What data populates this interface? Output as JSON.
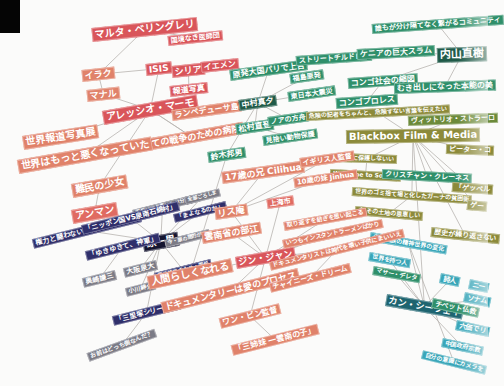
{
  "colors": {
    "background": "#fbfbfa",
    "red": "#d9555a",
    "salmon": "#e0826a",
    "coral": "#e06b62",
    "navy": "#2f2f6b",
    "gray": "#7b7b86",
    "black_node": "#151530",
    "green": "#2f8f6a",
    "dark_green": "#1f5a48",
    "olive": "#8c8a3a",
    "olive_green": "#6b8a3a",
    "teal": "#3aa6b8",
    "dark_teal": "#1e6470",
    "line": "#b8b4b0"
  },
  "nodes": [
    {
      "id": "maruta",
      "label": "マルタ・ベリングレリ",
      "x": 92,
      "y": 28,
      "fs": 10,
      "c": "red",
      "rot": -6
    },
    {
      "id": "kokkyo",
      "label": "国境なき医師団",
      "x": 168,
      "y": 36,
      "fs": 7,
      "c": "red",
      "rot": -6
    },
    {
      "id": "iraku",
      "label": "イラク",
      "x": 82,
      "y": 70,
      "fs": 9,
      "c": "salmon",
      "rot": -6
    },
    {
      "id": "isis",
      "label": "ISIS",
      "x": 146,
      "y": 64,
      "fs": 9,
      "c": "red",
      "rot": -6
    },
    {
      "id": "shiria",
      "label": "シリア",
      "x": 172,
      "y": 66,
      "fs": 9,
      "c": "red",
      "rot": -6
    },
    {
      "id": "yemen",
      "label": "イエメン",
      "x": 201,
      "y": 62,
      "fs": 8,
      "c": "red",
      "rot": -6
    },
    {
      "id": "manaru",
      "label": "マナル",
      "x": 87,
      "y": 90,
      "fs": 9,
      "c": "salmon",
      "rot": -6
    },
    {
      "id": "hodo",
      "label": "報道写真",
      "x": 170,
      "y": 86,
      "fs": 8,
      "c": "red",
      "rot": -6
    },
    {
      "id": "alessio",
      "label": "アレッシオ・マーモ",
      "x": 103,
      "y": 111,
      "fs": 10,
      "c": "red",
      "rot": -10
    },
    {
      "id": "lampedusa",
      "label": "ランペデューサ島",
      "x": 172,
      "y": 110,
      "fs": 8,
      "c": "salmon",
      "rot": -8
    },
    {
      "id": "sekaihodo",
      "label": "世界報道写真展",
      "x": 23,
      "y": 136,
      "fs": 10,
      "c": "salmon",
      "rot": -9
    },
    {
      "id": "subete",
      "label": "全ての戦争のための病院",
      "x": 140,
      "y": 140,
      "fs": 9,
      "c": "salmon",
      "rot": -10
    },
    {
      "id": "sekaiwa",
      "label": "世界はもっと悪くなっていた",
      "x": 18,
      "y": 160,
      "fs": 10,
      "c": "salmon",
      "rot": -10
    },
    {
      "id": "nanmin",
      "label": "難民の少女",
      "x": 72,
      "y": 184,
      "fs": 10,
      "c": "salmon",
      "rot": -10
    },
    {
      "id": "anman",
      "label": "アンマン",
      "x": 72,
      "y": 210,
      "fs": 10,
      "c": "coral",
      "rot": -10
    },
    {
      "id": "genpatsu",
      "label": "原発大国パリで上告",
      "x": 230,
      "y": 70,
      "fs": 8,
      "c": "green",
      "rot": -8
    },
    {
      "id": "fukushima",
      "label": "福島原発",
      "x": 290,
      "y": 74,
      "fs": 7,
      "c": "green",
      "rot": -8
    },
    {
      "id": "nakamura",
      "label": "中村真夕",
      "x": 239,
      "y": 100,
      "fs": 8,
      "c": "dark_green",
      "rot": -8
    },
    {
      "id": "higashi",
      "label": "東日本大震災",
      "x": 288,
      "y": 92,
      "fs": 7,
      "c": "green",
      "rot": -8
    },
    {
      "id": "matsumura",
      "label": "松村直登",
      "x": 236,
      "y": 124,
      "fs": 8,
      "c": "green",
      "rot": -8
    },
    {
      "id": "noah",
      "label": "ノアの方舟",
      "x": 268,
      "y": 117,
      "fs": 7,
      "c": "green",
      "rot": -8
    },
    {
      "id": "kikai",
      "label": "見捨い動物保護",
      "x": 263,
      "y": 136,
      "fs": 7,
      "c": "green",
      "rot": -8
    },
    {
      "id": "suzuki",
      "label": "鈴木邦男",
      "x": 208,
      "y": 152,
      "fs": 8,
      "c": "green",
      "rot": -8
    },
    {
      "id": "street",
      "label": "ストリートチルドレン",
      "x": 296,
      "y": 56,
      "fs": 7,
      "c": "green",
      "rot": -4
    },
    {
      "id": "congo_shakai",
      "label": "コンゴ社会の縮図",
      "x": 348,
      "y": 78,
      "fs": 8,
      "c": "green",
      "rot": -4
    },
    {
      "id": "congo_pro",
      "label": "コンゴプロレス",
      "x": 336,
      "y": 98,
      "fs": 8,
      "c": "green",
      "rot": -4
    },
    {
      "id": "daremo",
      "label": "誰もが分け隔てなく繋がるコミュニティ",
      "x": 372,
      "y": 24,
      "fs": 7,
      "c": "green",
      "rot": -4
    },
    {
      "id": "kenya",
      "label": "ケニアの巨大スラム",
      "x": 357,
      "y": 49,
      "fs": 8,
      "c": "green",
      "rot": -3
    },
    {
      "id": "uchiyama",
      "label": "内山直樹",
      "x": 437,
      "y": 48,
      "fs": 11,
      "c": "dark_green",
      "rot": -2
    },
    {
      "id": "mukidashi",
      "label": "むき出しになった本能の美",
      "x": 394,
      "y": 83,
      "fs": 8,
      "c": "green",
      "rot": -2
    },
    {
      "id": "kiken",
      "label": "危険の記者をちゃんと、危険すない言葉を伝えたい",
      "x": 306,
      "y": 112,
      "fs": 6,
      "c": "olive",
      "rot": -3
    },
    {
      "id": "vittorio",
      "label": "ヴィットリオ・ストラーロ",
      "x": 408,
      "y": 116,
      "fs": 7,
      "c": "olive_green",
      "rot": -2
    },
    {
      "id": "blackbox",
      "label": "Blackbox Film & Media",
      "x": 346,
      "y": 130,
      "fs": 10,
      "c": "olive",
      "rot": -1
    },
    {
      "id": "peter",
      "label": "ピーター・コ",
      "x": 446,
      "y": 144,
      "fs": 7,
      "c": "olive",
      "rot": 2
    },
    {
      "id": "kabe",
      "label": "記憶に保護しないい",
      "x": 337,
      "y": 153,
      "fs": 6,
      "c": "olive",
      "rot": 2
    },
    {
      "id": "welcome",
      "label": "Welcome to Sodom",
      "x": 330,
      "y": 169,
      "fs": 6,
      "c": "olive",
      "rot": 3
    },
    {
      "id": "christian",
      "label": "クリスチャン・クレーネス",
      "x": 382,
      "y": 169,
      "fs": 7,
      "c": "green",
      "rot": 3
    },
    {
      "id": "gepperu",
      "label": "「ゲッペル",
      "x": 452,
      "y": 182,
      "fs": 7,
      "c": "olive",
      "rot": 4
    },
    {
      "id": "sekainogomi",
      "label": "世界のゴミ捨て場と化したガーナの貧困街",
      "x": 352,
      "y": 187,
      "fs": 6,
      "c": "olive",
      "rot": 4
    },
    {
      "id": "ge",
      "label": "ゲー",
      "x": 467,
      "y": 200,
      "fs": 7,
      "c": "olive",
      "rot": 5
    },
    {
      "id": "sorenomono",
      "label": "会 その土地の恩恵しい",
      "x": 355,
      "y": 206,
      "fs": 6,
      "c": "olive",
      "rot": 5
    },
    {
      "id": "rekishi",
      "label": "歴史が繰り返さない",
      "x": 431,
      "y": 227,
      "fs": 7,
      "c": "olive",
      "rot": 6
    },
    {
      "id": "shosu",
      "label": "少数民族の精神世界の変化",
      "x": 370,
      "y": 232,
      "fs": 6,
      "c": "teal",
      "rot": 10
    },
    {
      "id": "sekai_hitori",
      "label": "世界を持つ人",
      "x": 369,
      "y": 252,
      "fs": 6,
      "c": "teal",
      "rot": 10
    },
    {
      "id": "mathew",
      "label": "マサー・デレタ",
      "x": 373,
      "y": 266,
      "fs": 6,
      "c": "green",
      "rot": 10
    },
    {
      "id": "shijin",
      "label": "詩人",
      "x": 440,
      "y": 273,
      "fs": 7,
      "c": "teal",
      "rot": 12
    },
    {
      "id": "ni",
      "label": "ニー",
      "x": 469,
      "y": 279,
      "fs": 7,
      "c": "teal",
      "rot": 12
    },
    {
      "id": "kang",
      "label": "カン・シーウェイ",
      "x": 386,
      "y": 294,
      "fs": 9,
      "c": "dark_teal",
      "rot": 10
    },
    {
      "id": "tibet",
      "label": "チベット仏教",
      "x": 432,
      "y": 298,
      "fs": 7,
      "c": "green",
      "rot": 12
    },
    {
      "id": "sonamu",
      "label": "ソナム",
      "x": 464,
      "y": 292,
      "fs": 7,
      "c": "teal",
      "rot": 12
    },
    {
      "id": "rokubyo",
      "label": "六価でリ",
      "x": 456,
      "y": 320,
      "fs": 7,
      "c": "teal",
      "rot": 12
    },
    {
      "id": "chugoku",
      "label": "中国政府宗教",
      "x": 442,
      "y": 338,
      "fs": 6,
      "c": "teal",
      "rot": 12
    },
    {
      "id": "jibun",
      "label": "自分の意識にカメラを",
      "x": 422,
      "y": 350,
      "fs": 6,
      "c": "teal",
      "rot": 14
    },
    {
      "id": "hara",
      "label": "原一男",
      "x": 143,
      "y": 238,
      "fs": 10,
      "c": "black_node",
      "rot": -10
    },
    {
      "id": "kenryoku",
      "label": "権力と闘わないと自由なんてない",
      "x": 33,
      "y": 239,
      "fs": 7,
      "c": "navy",
      "rot": -14
    },
    {
      "id": "tenno",
      "label": "天皇に詐り書いたが分間",
      "x": 133,
      "y": 210,
      "fs": 5,
      "c": "gray",
      "rot": -14
    },
    {
      "id": "anata",
      "label": "全部ごろしま",
      "x": 185,
      "y": 197,
      "fs": 5,
      "c": "gray",
      "rot": -14
    },
    {
      "id": "nippon",
      "label": "「ニッポン国VS泉南石綿村」",
      "x": 82,
      "y": 225,
      "fs": 7,
      "c": "navy",
      "rot": -14
    },
    {
      "id": "maineru",
      "label": "「まよなるのか」",
      "x": 174,
      "y": 214,
      "fs": 6,
      "c": "navy",
      "rot": -14
    },
    {
      "id": "yukiyuki",
      "label": "「ゆきゆきて、神軍」",
      "x": 86,
      "y": 251,
      "fs": 7,
      "c": "navy",
      "rot": -14
    },
    {
      "id": "ukinaru",
      "label": "今・原の間的が言",
      "x": 165,
      "y": 240,
      "fs": 5,
      "c": "gray",
      "rot": -14
    },
    {
      "id": "okuzaki",
      "label": "奥崎謙三",
      "x": 83,
      "y": 278,
      "fs": 7,
      "c": "gray",
      "rot": -14
    },
    {
      "id": "osawa",
      "label": "大阪泉大",
      "x": 124,
      "y": 268,
      "fs": 7,
      "c": "gray",
      "rot": -14
    },
    {
      "id": "ogawa",
      "label": "小川紳介",
      "x": 126,
      "y": 288,
      "fs": 6,
      "c": "gray",
      "rot": -14
    },
    {
      "id": "hiro",
      "label": "原三郎原 のため・国紙",
      "x": 155,
      "y": 273,
      "fs": 5,
      "c": "navy",
      "rot": -14
    },
    {
      "id": "sanrizuka",
      "label": "「三里塚シリーズ」",
      "x": 113,
      "y": 316,
      "fs": 7,
      "c": "navy",
      "rot": -14
    },
    {
      "id": "omaehadocchi",
      "label": "お前はどっち側なんだ？",
      "x": 88,
      "y": 353,
      "fs": 6,
      "c": "gray",
      "rot": -20
    },
    {
      "id": "juunanasai",
      "label": "17歳の兄 Cilihua",
      "x": 222,
      "y": 172,
      "fs": 9,
      "c": "salmon",
      "rot": -8
    },
    {
      "id": "igirisu",
      "label": "イギリス人監督",
      "x": 300,
      "y": 158,
      "fs": 7,
      "c": "salmon",
      "rot": -8
    },
    {
      "id": "jussai",
      "label": "10歳の妹 Jinhua",
      "x": 294,
      "y": 178,
      "fs": 7,
      "c": "salmon",
      "rot": -8
    },
    {
      "id": "risuan",
      "label": "リス庵",
      "x": 215,
      "y": 208,
      "fs": 9,
      "c": "salmon",
      "rot": -8
    },
    {
      "id": "jouro",
      "label": "上海市",
      "x": 267,
      "y": 199,
      "fs": 7,
      "c": "coral",
      "rot": -8
    },
    {
      "id": "unnansho",
      "label": "雲南省の部江",
      "x": 202,
      "y": 232,
      "fs": 9,
      "c": "salmon",
      "rot": -10
    },
    {
      "id": "arukazu",
      "label": "取り返すを紡ぎを思い起こる",
      "x": 284,
      "y": 222,
      "fs": 6,
      "c": "salmon",
      "rot": -10
    },
    {
      "id": "jinjan",
      "label": "ジン・ジャン",
      "x": 236,
      "y": 257,
      "fs": 9,
      "c": "red",
      "rot": -10
    },
    {
      "id": "itsumo",
      "label": "いつもインスタントラーメンばかり",
      "x": 283,
      "y": 240,
      "fs": 6,
      "c": "salmon",
      "rot": -12
    },
    {
      "id": "ningen",
      "label": "人間らしくなれる",
      "x": 148,
      "y": 276,
      "fs": 10,
      "c": "salmon",
      "rot": -12
    },
    {
      "id": "documentarist",
      "label": "ドキュメンタリストは時代を壊い子供にまいいえ",
      "x": 270,
      "y": 262,
      "fs": 6,
      "c": "salmon",
      "rot": -14
    },
    {
      "id": "documentary",
      "label": "ドキュメンタリーは愛のプロセス",
      "x": 162,
      "y": 302,
      "fs": 9,
      "c": "salmon",
      "rot": -14
    },
    {
      "id": "chinese",
      "label": "チャイニーズ・ドリーム",
      "x": 270,
      "y": 283,
      "fs": 7,
      "c": "salmon",
      "rot": -14
    },
    {
      "id": "wang",
      "label": "ワン・ビン監督",
      "x": 220,
      "y": 318,
      "fs": 8,
      "c": "salmon",
      "rot": -14
    },
    {
      "id": "sanshimai",
      "label": "「三姉妹 一雲南の子」",
      "x": 232,
      "y": 345,
      "fs": 8,
      "c": "salmon",
      "rot": -14
    }
  ],
  "edges": [
    [
      "maruta",
      "kokkyo"
    ],
    [
      "maruta",
      "iraku"
    ],
    [
      "iraku",
      "manaru"
    ],
    [
      "iraku",
      "isis"
    ],
    [
      "manaru",
      "alessio"
    ],
    [
      "isis",
      "alessio"
    ],
    [
      "alessio",
      "lampedusa"
    ],
    [
      "alessio",
      "sekaihodo"
    ],
    [
      "alessio",
      "subete"
    ],
    [
      "alessio",
      "sekaiwa"
    ],
    [
      "alessio",
      "nanmin"
    ],
    [
      "nanmin",
      "anman"
    ],
    [
      "shiria",
      "hodo"
    ],
    [
      "genpatsu",
      "nakamura"
    ],
    [
      "nakamura",
      "fukushima"
    ],
    [
      "nakamura",
      "higashi"
    ],
    [
      "nakamura",
      "matsumura"
    ],
    [
      "nakamura",
      "noah"
    ],
    [
      "matsumura",
      "kikai"
    ],
    [
      "nakamura",
      "suzuki"
    ],
    [
      "uchiyama",
      "daremo"
    ],
    [
      "uchiyama",
      "kenya"
    ],
    [
      "uchiyama",
      "mukidashi"
    ],
    [
      "uchiyama",
      "congo_shakai"
    ],
    [
      "kenya",
      "street"
    ],
    [
      "congo_shakai",
      "congo_pro"
    ],
    [
      "blackbox",
      "kiken"
    ],
    [
      "blackbox",
      "vittorio"
    ],
    [
      "blackbox",
      "peter"
    ],
    [
      "blackbox",
      "kabe"
    ],
    [
      "blackbox",
      "christian"
    ],
    [
      "blackbox",
      "gepperu"
    ],
    [
      "blackbox",
      "sekainogomi"
    ],
    [
      "blackbox",
      "ge"
    ],
    [
      "kabe",
      "welcome"
    ],
    [
      "sekainogomi",
      "sorenomono"
    ],
    [
      "blackbox",
      "rekishi"
    ],
    [
      "blackbox",
      "kang"
    ],
    [
      "kang",
      "shosu"
    ],
    [
      "kang",
      "sekai_hitori"
    ],
    [
      "kang",
      "mathew"
    ],
    [
      "kang",
      "shijin"
    ],
    [
      "kang",
      "tibet"
    ],
    [
      "kang",
      "sonamu"
    ],
    [
      "kang",
      "rokubyo"
    ],
    [
      "kang",
      "chugoku"
    ],
    [
      "shosu",
      "jibun"
    ],
    [
      "hara",
      "kenryoku"
    ],
    [
      "hara",
      "tenno"
    ],
    [
      "hara",
      "anata"
    ],
    [
      "hara",
      "nippon"
    ],
    [
      "hara",
      "maineru"
    ],
    [
      "hara",
      "yukiyuki"
    ],
    [
      "hara",
      "ukinaru"
    ],
    [
      "hara",
      "osawa"
    ],
    [
      "hara",
      "ogawa"
    ],
    [
      "hara",
      "hiro"
    ],
    [
      "yukiyuki",
      "okuzaki"
    ],
    [
      "hara",
      "sanrizuka"
    ],
    [
      "sanrizuka",
      "omaehadocchi"
    ],
    [
      "jinjan",
      "risuan"
    ],
    [
      "jinjan",
      "unnansho"
    ],
    [
      "jinjan",
      "jouro"
    ],
    [
      "jinjan",
      "arukazu"
    ],
    [
      "jinjan",
      "itsumo"
    ],
    [
      "jinjan",
      "documentarist"
    ],
    [
      "jinjan",
      "ningen"
    ],
    [
      "jinjan",
      "documentary"
    ],
    [
      "jinjan",
      "wang"
    ],
    [
      "risuan",
      "juunanasai"
    ],
    [
      "risuan",
      "jussai"
    ],
    [
      "risuan",
      "igirisu"
    ],
    [
      "documentarist",
      "chinese"
    ],
    [
      "wang",
      "sanshimai"
    ],
    [
      "suzuki",
      "ningen"
    ],
    [
      "subete",
      "alessio"
    ]
  ]
}
